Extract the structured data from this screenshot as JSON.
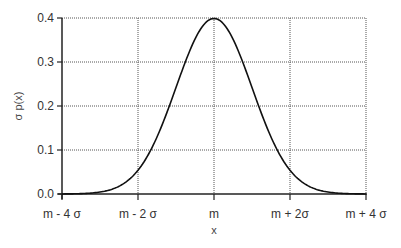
{
  "chart_data": {
    "type": "line",
    "title": "",
    "xlabel": "x",
    "ylabel": "σ p(x)",
    "x_ticks": [
      "m - 4 σ",
      "m - 2 σ",
      "m",
      "m + 2σ",
      "m + 4 σ"
    ],
    "x_tick_values": [
      -4,
      -2,
      0,
      2,
      4
    ],
    "y_ticks": [
      "0.0",
      "0.1",
      "0.2",
      "0.3",
      "0.4"
    ],
    "y_tick_values": [
      0.0,
      0.1,
      0.2,
      0.3,
      0.4
    ],
    "xlim": [
      -4,
      4
    ],
    "ylim": [
      0,
      0.4
    ],
    "grid": true,
    "legend": null,
    "series": [
      {
        "name": "Gaussian σ p(x)",
        "x": [
          -4,
          -3.5,
          -3,
          -2.5,
          -2,
          -1.5,
          -1,
          -0.5,
          0,
          0.5,
          1,
          1.5,
          2,
          2.5,
          3,
          3.5,
          4
        ],
        "values": [
          0.0001,
          0.0009,
          0.0044,
          0.0175,
          0.054,
          0.1295,
          0.242,
          0.3521,
          0.3989,
          0.3521,
          0.242,
          0.1295,
          0.054,
          0.0175,
          0.0044,
          0.0009,
          0.0001
        ]
      }
    ]
  },
  "plot": {
    "left": 62,
    "right": 366,
    "top": 18,
    "bottom": 194,
    "line_color": "#111111",
    "grid_color": "#555555",
    "axis_color": "#222222"
  }
}
